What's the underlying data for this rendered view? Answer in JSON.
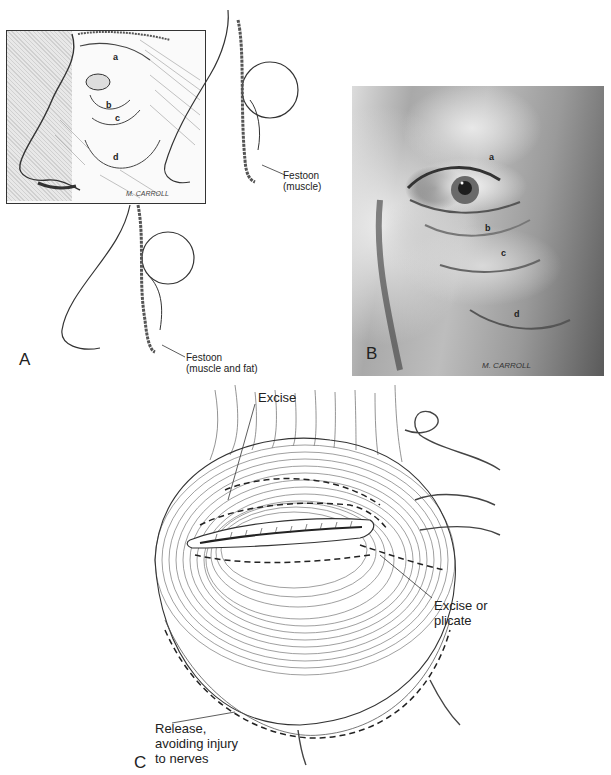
{
  "figure": {
    "panels": [
      {
        "id": "A",
        "letter": "A",
        "description": "Line drawings: external view of eye region with labeled bulges, and two sagittal cross-sections of orbit",
        "region_labels": [
          "a",
          "b",
          "c",
          "d"
        ],
        "callouts": [
          {
            "text": "Festoon\n(muscle)"
          },
          {
            "text": "Festoon\n(muscle and fat)"
          }
        ],
        "signature": "M. CARROLL"
      },
      {
        "id": "B",
        "letter": "B",
        "description": "Grayscale painting of periorbital region showing lower eyelid bags and festoon",
        "region_labels": [
          "a",
          "b",
          "c",
          "d"
        ],
        "signature": "M. CARROLL"
      },
      {
        "id": "C",
        "letter": "C",
        "description": "Orbicularis oculi muscle diagram with dashed excision and release lines",
        "callouts": [
          {
            "text": "Excise"
          },
          {
            "text": "Excise or\nplicate"
          },
          {
            "text": "Release,\navoiding injury\nto nerves"
          }
        ]
      }
    ]
  },
  "colors": {
    "ink": "#222222",
    "background": "#ffffff",
    "photo_dark": "#3a3a3a",
    "photo_light": "#ececec"
  }
}
